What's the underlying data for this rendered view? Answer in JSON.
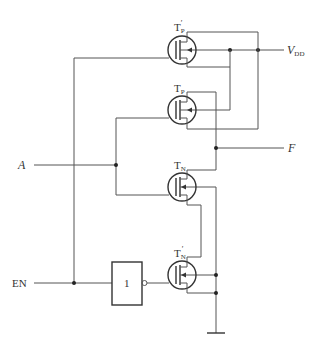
{
  "diagram": {
    "type": "CMOS tri-state output circuit",
    "inputs": {
      "a_label": "A",
      "en_label": "EN"
    },
    "outputs": {
      "f_label": "F"
    },
    "supply": {
      "vdd_main": "V",
      "vdd_sub": "DD"
    },
    "transistors": [
      {
        "id": "tp_prime",
        "main": "T",
        "sub": "P",
        "prime": "′"
      },
      {
        "id": "tp",
        "main": "T",
        "sub": "P",
        "prime": ""
      },
      {
        "id": "tn",
        "main": "T",
        "sub": "N",
        "prime": ""
      },
      {
        "id": "tn_prime",
        "main": "T",
        "sub": "N",
        "prime": "′"
      }
    ],
    "not_gate": {
      "label": "1"
    },
    "colors": {
      "wire": "#555555",
      "text": "#333333",
      "background": "#ffffff"
    }
  }
}
